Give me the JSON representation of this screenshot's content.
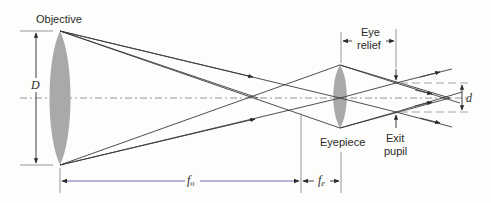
{
  "figure": {
    "labels": {
      "objective": "Objective",
      "eyepiece": "Eyepiece",
      "eye_relief_line1": "Eye",
      "eye_relief_line2": "relief",
      "exit_pupil_line1": "Exit",
      "exit_pupil_line2": "pupil",
      "objective_diameter": "D",
      "exit_pupil_diameter": "d",
      "objective_focal_symbol": "f",
      "objective_focal_sub": "o",
      "eyepiece_focal_symbol": "f",
      "eyepiece_focal_sub": "e"
    },
    "colors": {
      "lens": "#a9a9a9",
      "ray": "#3a3a3a",
      "focal_length_line": "#6f6fb8",
      "optical_axis": "#8a8a8a"
    }
  }
}
